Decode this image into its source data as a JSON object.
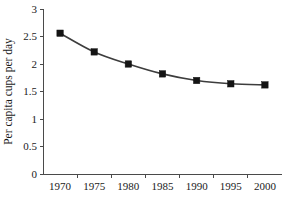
{
  "chart_data": {
    "type": "line",
    "title": "",
    "xlabel": "",
    "ylabel": "Per capita cups per day",
    "x": [
      1970,
      1975,
      1980,
      1985,
      1990,
      1995,
      2000
    ],
    "values": [
      2.56,
      2.22,
      2.0,
      1.82,
      1.7,
      1.64,
      1.62
    ],
    "xtick_labels": [
      "1970",
      "1975",
      "1980",
      "1985",
      "1990",
      "1995",
      "2000"
    ],
    "ytick_labels": [
      "0",
      "0.5",
      "1",
      "1.5",
      "2",
      "2.5",
      "3"
    ],
    "ytick_values": [
      0,
      0.5,
      1,
      1.5,
      2,
      2.5,
      3
    ],
    "ylim": [
      0,
      3
    ],
    "xlim": [
      1967.5,
      2002.5
    ],
    "grid": false,
    "legend": false,
    "marker": "filled-square",
    "line_color": "#3d3d3d",
    "marker_color": "#141414",
    "axis_color": "#4a4a4a",
    "background_color": "#ffffff",
    "series": [
      {
        "name": "Per capita cups per day",
        "values": [
          2.56,
          2.22,
          2.0,
          1.82,
          1.7,
          1.64,
          1.62
        ]
      }
    ]
  }
}
